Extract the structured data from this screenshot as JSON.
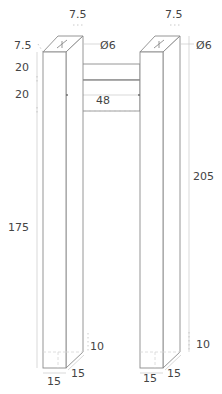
{
  "drawing": {
    "title": "Pull handle dimensions",
    "units": "mm",
    "colors": {
      "lines": "#8a8a8a",
      "dimension_lines": "#c9c9c9",
      "text": "#444444"
    }
  },
  "labels": {
    "left_top_width": "7.5",
    "left_top_depth": "7.5",
    "left_hole_diameter": "Ø6",
    "right_top_width": "7.5",
    "right_hole_diameter": "Ø6",
    "upper_offset": "20",
    "bar_height": "20",
    "bar_length": "48",
    "post_height_left": "175",
    "post_height_right": "205",
    "left_base_height": "10",
    "right_base_height": "10",
    "left_base_width": "15",
    "left_base_depth": "15",
    "right_base_width": "15",
    "right_base_depth": "15"
  }
}
